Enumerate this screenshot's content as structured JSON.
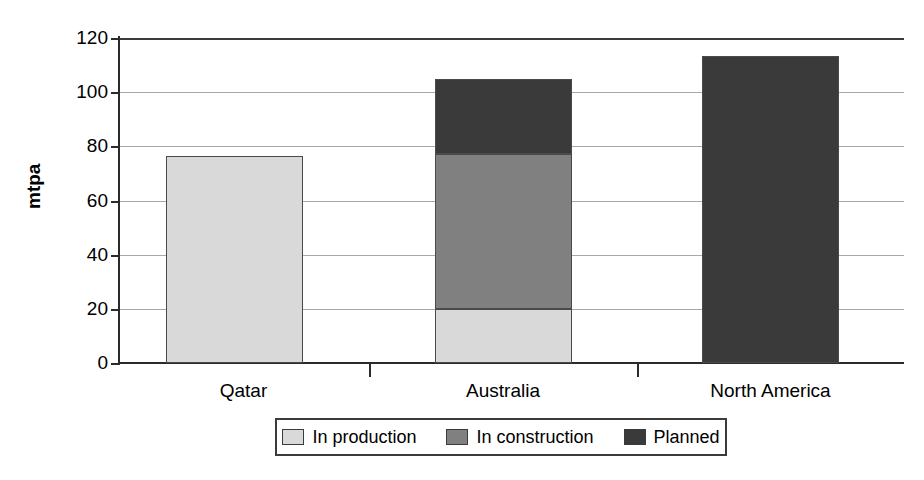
{
  "chart_data": {
    "type": "bar",
    "subtype": "stacked-bar",
    "title": "",
    "xlabel": "",
    "ylabel": "mtpa",
    "ylim": [
      0,
      120
    ],
    "yticks": [
      0,
      20,
      40,
      60,
      80,
      100,
      120
    ],
    "ytick_labels": [
      "0",
      "20",
      "40",
      "60",
      "80",
      "100",
      "120"
    ],
    "grid": true,
    "grid_axis": "y",
    "legend_position": "bottom-center",
    "categories": [
      "Qatar",
      "Australia",
      "North America"
    ],
    "series": [
      {
        "name": "In production",
        "color": "#d9d9d9",
        "values": [
          76.5,
          20,
          0
        ]
      },
      {
        "name": "In construction",
        "color": "#808080",
        "values": [
          0,
          57,
          0
        ]
      },
      {
        "name": "Planned",
        "color": "#3a3a3a",
        "values": [
          0,
          28,
          113.5
        ]
      }
    ],
    "totals": [
      76.5,
      105,
      113.5
    ]
  },
  "axis": {
    "y_title": "mtpa",
    "y_ticks": [
      {
        "label": "120",
        "value": 120
      },
      {
        "label": "100",
        "value": 100
      },
      {
        "label": "80",
        "value": 80
      },
      {
        "label": "60",
        "value": 60
      },
      {
        "label": "40",
        "value": 40
      },
      {
        "label": "20",
        "value": 20
      },
      {
        "label": "0",
        "value": 0
      }
    ],
    "categories": [
      {
        "label": "Qatar"
      },
      {
        "label": "Australia"
      },
      {
        "label": "North America"
      }
    ]
  },
  "legend": {
    "items": [
      {
        "label": "In production",
        "color": "#d9d9d9"
      },
      {
        "label": "In construction",
        "color": "#808080"
      },
      {
        "label": "Planned",
        "color": "#3a3a3a"
      }
    ]
  },
  "colors": {
    "in_production": "#d9d9d9",
    "in_construction": "#808080",
    "planned": "#3a3a3a",
    "axis": "#2b2b2b",
    "grid": "#a8a8a8",
    "bar_outline": "#4a4a4a",
    "background": "#ffffff"
  }
}
